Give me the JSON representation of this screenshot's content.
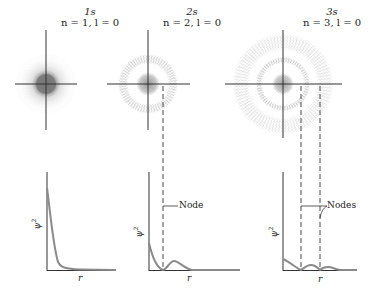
{
  "panels": [
    {
      "orbital": "1s",
      "quantum_numbers": "n = 1, l = 0",
      "y_label": "ψ2",
      "y_label_base": "ψ",
      "y_label_sup": "2",
      "x_label": "r",
      "node_label": ""
    },
    {
      "orbital": "2s",
      "quantum_numbers": "n = 2, l = 0",
      "y_label_base": "ψ",
      "y_label_sup": "2",
      "x_label": "r",
      "node_label": "Node"
    },
    {
      "orbital": "3s",
      "quantum_numbers": "n = 3, l = 0",
      "y_label_base": "ψ",
      "y_label_sup": "2",
      "x_label": "r",
      "node_label": "Nodes"
    }
  ],
  "colors": {
    "axis": "#333333",
    "curve": "#8a8a8a",
    "cloud": "#7a7a7a",
    "background": "#ffffff"
  }
}
